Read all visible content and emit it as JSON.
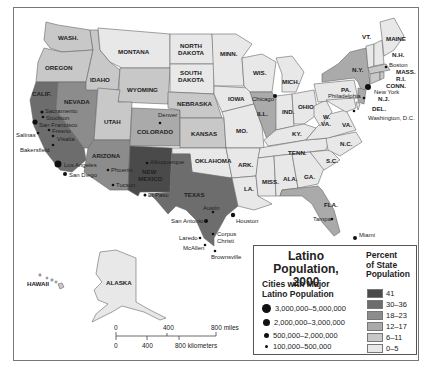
{
  "map": {
    "title": "Latino Population, 2000",
    "title_line1": "Latino Population,",
    "title_line2": "2000",
    "colors": {
      "41": "#4a4a4a",
      "30-36": "#6d6d6d",
      "18-23": "#8c8c8c",
      "12-17": "#aaaaaa",
      "6-11": "#c8c8c8",
      "0-5": "#e8e8e8",
      "water": "#ffffff",
      "border": "#666666"
    },
    "states": [
      {
        "abbr": "WASH.",
        "category": "6-11"
      },
      {
        "abbr": "OREGON",
        "category": "6-11"
      },
      {
        "abbr": "CALIF.",
        "category": "30-36"
      },
      {
        "abbr": "NEVADA",
        "category": "18-23"
      },
      {
        "abbr": "IDAHO",
        "category": "6-11"
      },
      {
        "abbr": "MONTANA",
        "category": "0-5"
      },
      {
        "abbr": "WYOMING",
        "category": "6-11"
      },
      {
        "abbr": "UTAH",
        "category": "6-11"
      },
      {
        "abbr": "ARIZONA",
        "category": "18-23"
      },
      {
        "abbr": "COLORADO",
        "category": "12-17"
      },
      {
        "abbr": "NEW MEXICO",
        "category": "41"
      },
      {
        "abbr": "NORTH DAKOTA",
        "category": "0-5"
      },
      {
        "abbr": "SOUTH DAKOTA",
        "category": "0-5"
      },
      {
        "abbr": "NEBRASKA",
        "category": "6-11"
      },
      {
        "abbr": "KANSAS",
        "category": "6-11"
      },
      {
        "abbr": "OKLAHOMA",
        "category": "0-5"
      },
      {
        "abbr": "TEXAS",
        "category": "30-36"
      },
      {
        "abbr": "MINN.",
        "category": "0-5"
      },
      {
        "abbr": "IOWA",
        "category": "0-5"
      },
      {
        "abbr": "MO.",
        "category": "0-5"
      },
      {
        "abbr": "ARK.",
        "category": "0-5"
      },
      {
        "abbr": "LA.",
        "category": "0-5"
      },
      {
        "abbr": "WIS.",
        "category": "0-5"
      },
      {
        "abbr": "ILL.",
        "category": "12-17"
      },
      {
        "abbr": "MICH.",
        "category": "0-5"
      },
      {
        "abbr": "IND.",
        "category": "0-5"
      },
      {
        "abbr": "OHIO",
        "category": "0-5"
      },
      {
        "abbr": "KY.",
        "category": "0-5"
      },
      {
        "abbr": "TENN.",
        "category": "0-5"
      },
      {
        "abbr": "MISS.",
        "category": "0-5"
      },
      {
        "abbr": "ALA.",
        "category": "0-5"
      },
      {
        "abbr": "GA.",
        "category": "0-5"
      },
      {
        "abbr": "FLA.",
        "category": "12-17"
      },
      {
        "abbr": "S.C.",
        "category": "0-5"
      },
      {
        "abbr": "N.C.",
        "category": "0-5"
      },
      {
        "abbr": "VA.",
        "category": "0-5"
      },
      {
        "abbr": "W. VA.",
        "category": "0-5"
      },
      {
        "abbr": "PA.",
        "category": "0-5"
      },
      {
        "abbr": "N.Y.",
        "category": "12-17"
      },
      {
        "abbr": "VT.",
        "category": "0-5"
      },
      {
        "abbr": "N.H.",
        "category": "0-5"
      },
      {
        "abbr": "MAINE",
        "category": "0-5"
      },
      {
        "abbr": "MASS.",
        "category": "6-11"
      },
      {
        "abbr": "R.I.",
        "category": "6-11"
      },
      {
        "abbr": "CONN.",
        "category": "6-11"
      },
      {
        "abbr": "N.J.",
        "category": "12-17"
      },
      {
        "abbr": "DEL.",
        "category": "0-5"
      },
      {
        "abbr": "MD.",
        "category": "0-5"
      },
      {
        "abbr": "ALASKA",
        "category": "0-5"
      },
      {
        "abbr": "HAWAII",
        "category": "6-11"
      }
    ],
    "state_labels": {
      "wash": "WASH.",
      "oregon": "OREGON",
      "calif": "CALIF.",
      "nevada": "NEVADA",
      "idaho": "IDAHO",
      "montana": "MONTANA",
      "wyoming": "WYOMING",
      "utah": "UTAH",
      "arizona": "ARIZONA",
      "colorado": "COLORADO",
      "nm1": "NEW",
      "nm2": "MEXICO",
      "nd1": "NORTH",
      "nd2": "DAKOTA",
      "sd1": "SOUTH",
      "sd2": "DAKOTA",
      "nebraska": "NEBRASKA",
      "kansas": "KANSAS",
      "oklahoma": "OKLAHOMA",
      "texas": "TEXAS",
      "minn": "MINN.",
      "iowa": "IOWA",
      "mo": "MO.",
      "ark": "ARK.",
      "la": "LA.",
      "wis": "WIS.",
      "ill": "ILL.",
      "mich": "MICH.",
      "ind": "IND.",
      "ohio": "OHIO",
      "ky": "KY.",
      "tenn": "TENN.",
      "miss": "MISS.",
      "ala": "ALA.",
      "ga": "GA.",
      "fla": "FLA.",
      "sc": "S.C.",
      "nc": "N.C.",
      "va": "VA.",
      "wva1": "W.",
      "wva2": "VA.",
      "pa": "PA.",
      "ny": "N.Y.",
      "vt": "VT.",
      "nh": "N.H.",
      "maine": "MAINE",
      "mass": "MASS.",
      "ri": "R.I.",
      "conn": "CONN.",
      "nj": "N.J.",
      "del": "DEL.",
      "alaska": "ALASKA",
      "hawaii": "HAWAII"
    },
    "cities": [
      {
        "name": "Sacramento",
        "size": "500,000–2,000,000"
      },
      {
        "name": "Stockton",
        "size": "100,000–500,000"
      },
      {
        "name": "San Francisco",
        "size": "2,000,000–3,000,000"
      },
      {
        "name": "Salinas",
        "size": "100,000–500,000"
      },
      {
        "name": "Fresno",
        "size": "100,000–500,000"
      },
      {
        "name": "Visalia",
        "size": "100,000–500,000"
      },
      {
        "name": "Bakersfield",
        "size": "100,000–500,000"
      },
      {
        "name": "Los Angeles",
        "size": "3,000,000–5,000,000"
      },
      {
        "name": "San Diego",
        "size": "500,000–2,000,000"
      },
      {
        "name": "Phoenix",
        "size": "100,000–500,000"
      },
      {
        "name": "Tucson",
        "size": "100,000–500,000"
      },
      {
        "name": "Denver",
        "size": "100,000–500,000"
      },
      {
        "name": "Albuquerque",
        "size": "100,000–500,000"
      },
      {
        "name": "El Paso",
        "size": "100,000–500,000"
      },
      {
        "name": "Austin",
        "size": "100,000–500,000"
      },
      {
        "name": "San Antonio",
        "size": "500,000–2,000,000"
      },
      {
        "name": "Houston",
        "size": "500,000–2,000,000"
      },
      {
        "name": "Corpus Christi",
        "size": "100,000–500,000"
      },
      {
        "name": "Laredo",
        "size": "100,000–500,000"
      },
      {
        "name": "McAllen",
        "size": "100,000–500,000"
      },
      {
        "name": "Brownsville",
        "size": "100,000–500,000"
      },
      {
        "name": "Chicago",
        "size": "500,000–2,000,000"
      },
      {
        "name": "Tampa",
        "size": "100,000–500,000"
      },
      {
        "name": "Miami",
        "size": "500,000–2,000,000"
      },
      {
        "name": "New York",
        "size": "2,000,000–3,000,000"
      },
      {
        "name": "Boston",
        "size": "100,000–500,000"
      },
      {
        "name": "Philadelphia",
        "size": "100,000–500,000"
      },
      {
        "name": "Washington, D.C.",
        "size": "100,000–500,000"
      }
    ],
    "city_labels": {
      "sacramento": "Sacramento",
      "stockton": "Stockton",
      "sf": "San Francisco",
      "salinas": "Salinas",
      "fresno": "Fresno",
      "visalia": "Visalia",
      "bakersfield": "Bakersfield",
      "la": "Los Angeles",
      "sd": "San Diego",
      "phoenix": "Phoenix",
      "tucson": "Tucson",
      "denver": "Denver",
      "albuquerque": "Albuquerque",
      "elpaso": "El Paso",
      "austin": "Austin",
      "sanantonio": "San Antonio",
      "houston": "Houston",
      "corpus1": "Corpus",
      "corpus2": "Christi",
      "laredo": "Laredo",
      "mcallen": "McAllen",
      "brownsville": "Brownsville",
      "chicago": "Chicago",
      "tampa": "Tampa",
      "miami": "Miami",
      "newyork": "New York",
      "boston": "Boston",
      "philadelphia": "Philadelphia",
      "dc": "Washington, D.C."
    },
    "scale": {
      "miles": [
        "0",
        "400",
        "800 miles"
      ],
      "km": [
        "0",
        "400",
        "800 kilometers"
      ]
    }
  },
  "legend": {
    "cities_title_line1": "Cities with Major",
    "cities_title_line2": "Latino Population",
    "city_sizes": [
      {
        "label": "3,000,000–5,000,000",
        "dot": 9
      },
      {
        "label": "2,000,000–3,000,000",
        "dot": 7
      },
      {
        "label": "500,000–2,000,000",
        "dot": 5
      },
      {
        "label": "100,000–500,000",
        "dot": 3
      }
    ],
    "pct_title_line1": "Percent",
    "pct_title_line2": "of State",
    "pct_title_line3": "Population",
    "pct_classes": [
      {
        "label": "41",
        "color": "#4a4a4a"
      },
      {
        "label": "30–36",
        "color": "#6d6d6d"
      },
      {
        "label": "18–23",
        "color": "#8c8c8c"
      },
      {
        "label": "12–17",
        "color": "#aaaaaa"
      },
      {
        "label": "6–11",
        "color": "#c8c8c8"
      },
      {
        "label": "0–5",
        "color": "#e8e8e8"
      }
    ]
  }
}
